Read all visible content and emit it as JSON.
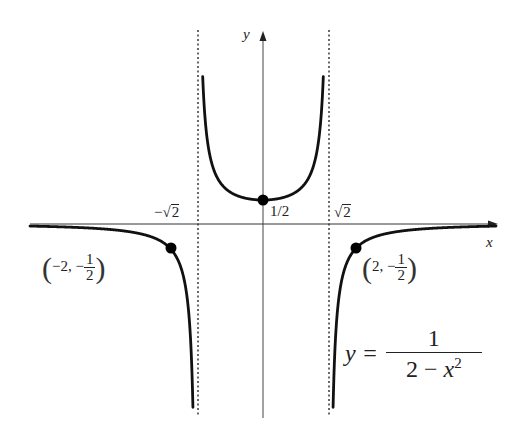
{
  "chart_data": {
    "type": "line",
    "title": "",
    "function": "y = 1/(2 - x^2)",
    "xlabel": "x",
    "ylabel": "y",
    "xlim": [
      -5.2,
      5.0
    ],
    "ylim": [
      -4.0,
      3.9
    ],
    "grid": false,
    "asymptotes": {
      "vertical": [
        "-√2",
        "√2"
      ],
      "horizontal": [
        "y = 0"
      ]
    },
    "series": [
      {
        "name": "left branch",
        "domain": [
          -5.0,
          -1.4142
        ],
        "x": [
          -5.0,
          -4.0,
          -3.0,
          -2.5,
          -2.0,
          -1.8,
          -1.6,
          -1.5,
          -1.45
        ],
        "y": [
          -0.043,
          -0.071,
          -0.143,
          -0.235,
          -0.5,
          -0.806,
          -1.773,
          -4.0,
          -9.9
        ]
      },
      {
        "name": "middle branch",
        "domain": [
          -1.4142,
          1.4142
        ],
        "x": [
          -1.35,
          -1.2,
          -1.0,
          -0.5,
          0.0,
          0.5,
          1.0,
          1.2,
          1.35
        ],
        "y": [
          3.79,
          1.79,
          1.0,
          0.571,
          0.5,
          0.571,
          1.0,
          1.79,
          3.79
        ]
      },
      {
        "name": "right branch",
        "domain": [
          1.4142,
          5.0
        ],
        "x": [
          1.45,
          1.5,
          1.6,
          1.8,
          2.0,
          2.5,
          3.0,
          4.0,
          5.0
        ],
        "y": [
          -9.9,
          -4.0,
          -1.773,
          -0.806,
          -0.5,
          -0.235,
          -0.143,
          -0.071,
          -0.043
        ]
      }
    ],
    "highlighted_points": [
      {
        "x": 0,
        "y": 0.5,
        "label": "1/2"
      },
      {
        "x": -2,
        "y": -0.5,
        "label": "(-2, -1/2)"
      },
      {
        "x": 2,
        "y": -0.5,
        "label": "(2, -1/2)"
      }
    ],
    "tick_labels": [
      "-√2",
      "1/2",
      "√2"
    ],
    "annotations": [
      "y = 1/(2 - x²)"
    ]
  },
  "labels": {
    "x_axis": "x",
    "y_axis": "y",
    "neg_sqrt2_minus": "−",
    "sqrt2_sym": "√",
    "sqrt2_radicand": "2",
    "y_intercept": "1/2",
    "left_point_x": "−2, −",
    "left_point_num": "1",
    "left_point_den": "2",
    "right_point_x": "2, −",
    "right_point_num": "1",
    "right_point_den": "2",
    "paren_open": "(",
    "paren_close": ")",
    "equation_lhs": "y =",
    "equation_num": "1",
    "equation_den_a": "2 − ",
    "equation_den_x": "x",
    "equation_den_exp": "2"
  },
  "colors": {
    "curve": "#111111",
    "axis": "#333333",
    "asymptote": "#444444",
    "background": "#ffffff"
  }
}
